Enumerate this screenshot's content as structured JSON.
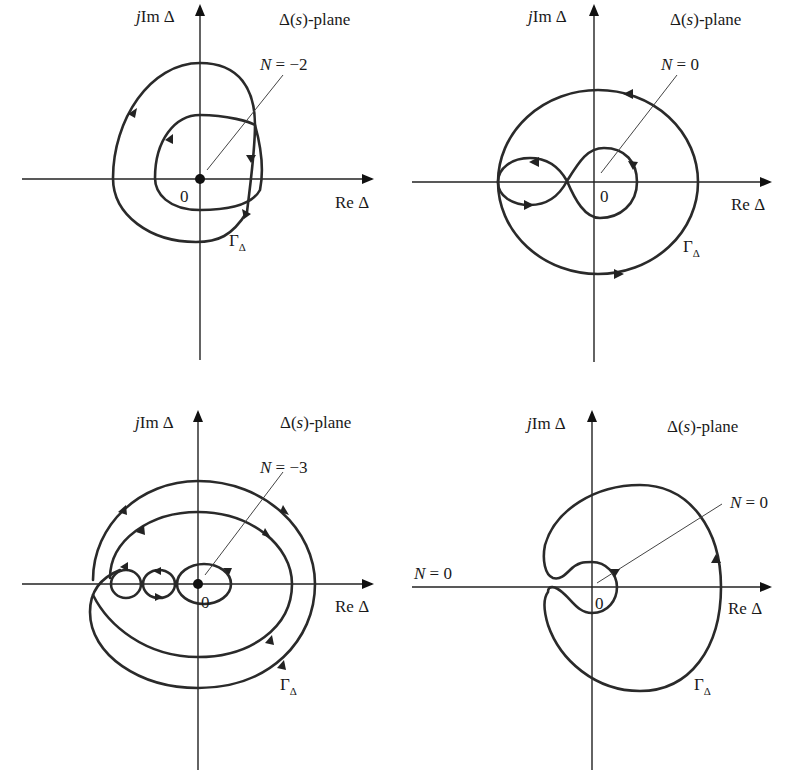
{
  "figure": {
    "panels": [
      {
        "id": "a",
        "axis_y_label_j": "j",
        "axis_y_label_rest": "Im Δ",
        "axis_x_label": "Re Δ",
        "plane_label_prefix": "Δ(",
        "plane_label_var": "s",
        "plane_label_suffix": ")-plane",
        "origin_label": "0",
        "encirclement_var": "N",
        "encirclement_value": " = −2",
        "contour_label_main": "Γ",
        "contour_label_sub": "Δ",
        "origin_marked": true
      },
      {
        "id": "b",
        "axis_y_label_j": "j",
        "axis_y_label_rest": "Im Δ",
        "axis_x_label": "Re Δ",
        "plane_label_prefix": "Δ(",
        "plane_label_var": "s",
        "plane_label_suffix": ")-plane",
        "origin_label": "0",
        "encirclement_var": "N",
        "encirclement_value": " = 0",
        "contour_label_main": "Γ",
        "contour_label_sub": "Δ",
        "origin_marked": false
      },
      {
        "id": "c",
        "axis_y_label_j": "j",
        "axis_y_label_rest": "Im Δ",
        "axis_x_label": "Re Δ",
        "plane_label_prefix": "Δ(",
        "plane_label_var": "s",
        "plane_label_suffix": ")-plane",
        "origin_label": "0",
        "encirclement_var": "N",
        "encirclement_value": " = −3",
        "contour_label_main": "Γ",
        "contour_label_sub": "Δ",
        "origin_marked": true
      },
      {
        "id": "d",
        "axis_y_label_j": "j",
        "axis_y_label_rest": "Im Δ",
        "axis_x_label": "Re Δ",
        "plane_label_prefix": "Δ(",
        "plane_label_var": "s",
        "plane_label_suffix": ")-plane",
        "origin_label": "0",
        "encirclement_var": "N",
        "encirclement_value": " = 0",
        "extra_label_var": "N",
        "extra_label_value": " = 0",
        "contour_label_main": "Γ",
        "contour_label_sub": "Δ",
        "origin_marked": false
      }
    ]
  }
}
